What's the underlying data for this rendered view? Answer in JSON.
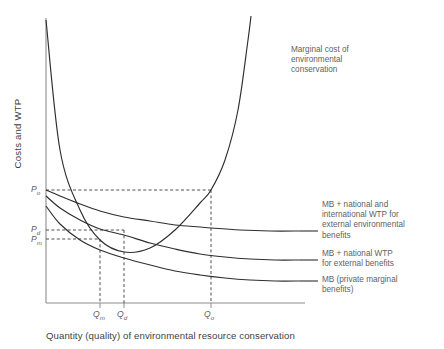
{
  "chart_data": {
    "type": "line",
    "title": "",
    "xlabel": "Quantity (quality) of environmental resource conservation",
    "ylabel": "Costs and WTP",
    "grid": false,
    "legend_position": "right-inline",
    "axis_ranges": {
      "x": [
        0,
        1
      ],
      "y": [
        0,
        1
      ]
    },
    "series": [
      {
        "name": "Marginal cost of environmental conservation",
        "label_lines": [
          "Marginal cost of",
          "environmental",
          "conservation"
        ],
        "shape": "increasing-convex",
        "points_px": [
          [
            46,
            20
          ],
          [
            60,
            150
          ],
          [
            80,
            210
          ],
          [
            100,
            240
          ],
          [
            124,
            252
          ],
          [
            150,
            248
          ],
          [
            175,
            230
          ],
          [
            200,
            203
          ],
          [
            211,
            190
          ],
          [
            225,
            160
          ],
          [
            238,
            110
          ],
          [
            248,
            40
          ],
          [
            251,
            16
          ]
        ]
      },
      {
        "name": "MB + national and international WTP for external environmental benefits",
        "label_lines": [
          "MB + national and",
          "international WTP for",
          "external environmental",
          "benefits"
        ],
        "shape": "decreasing-convex",
        "points_px": [
          [
            46,
            190
          ],
          [
            60,
            196
          ],
          [
            80,
            204
          ],
          [
            100,
            211
          ],
          [
            124,
            217
          ],
          [
            150,
            221
          ],
          [
            175,
            225
          ],
          [
            200,
            227
          ],
          [
            211,
            228
          ],
          [
            240,
            230
          ],
          [
            270,
            231
          ],
          [
            300,
            231
          ]
        ]
      },
      {
        "name": "MB + national WTP for external benefits",
        "label_lines": [
          "MB + national WTP",
          "for external benefits"
        ],
        "shape": "decreasing-convex",
        "points_px": [
          [
            46,
            196
          ],
          [
            60,
            208
          ],
          [
            80,
            220
          ],
          [
            100,
            229
          ],
          [
            124,
            235
          ],
          [
            150,
            243
          ],
          [
            175,
            249
          ],
          [
            200,
            254
          ],
          [
            225,
            257
          ],
          [
            250,
            259
          ],
          [
            275,
            260
          ],
          [
            300,
            260
          ]
        ]
      },
      {
        "name": "MB (private marginal benefits)",
        "label_lines": [
          "MB (private marginal",
          "benefits)"
        ],
        "shape": "decreasing-convex",
        "points_px": [
          [
            46,
            206
          ],
          [
            60,
            224
          ],
          [
            80,
            240
          ],
          [
            100,
            250
          ],
          [
            124,
            258
          ],
          [
            150,
            265
          ],
          [
            175,
            271
          ],
          [
            200,
            275
          ],
          [
            225,
            278
          ],
          [
            250,
            280
          ],
          [
            275,
            281
          ],
          [
            300,
            281
          ]
        ]
      }
    ],
    "equilibria": [
      {
        "name": "market",
        "x_label": "Qm",
        "y_label": "Pm",
        "x_px": 100,
        "y_px": 239
      },
      {
        "name": "domestic",
        "x_label": "Qd",
        "y_label": "Pd",
        "x_px": 124,
        "y_px": 230
      },
      {
        "name": "optimal",
        "x_label": "Qo",
        "y_label": "Po",
        "x_px": 211,
        "y_px": 190
      }
    ],
    "x_ticks": [
      {
        "label": "Q",
        "sub": "m",
        "x_px": 100
      },
      {
        "label": "Q",
        "sub": "d",
        "x_px": 124
      },
      {
        "label": "Q",
        "sub": "o",
        "x_px": 211
      }
    ],
    "y_ticks": [
      {
        "label": "P",
        "sub": "o",
        "y_px": 190
      },
      {
        "label": "P",
        "sub": "d",
        "y_px": 230
      },
      {
        "label": "P",
        "sub": "m",
        "y_px": 239
      }
    ],
    "colors": {
      "curve": "#2e2e2e",
      "axis": "#8c8c8c",
      "dashed": "#3a3a3a",
      "text": "#5a5a5a"
    }
  },
  "axes": {
    "y_title": "Costs and WTP",
    "x_title": "Quantity (quality) of environmental resource conservation"
  },
  "tick_labels": {
    "qm": "Q",
    "qm_sub": "m",
    "qd": "Q",
    "qd_sub": "d",
    "qo": "Q",
    "qo_sub": "o",
    "po": "P",
    "po_sub": "o",
    "pd": "P",
    "pd_sub": "d",
    "pm": "P",
    "pm_sub": "m"
  },
  "annotations": {
    "mc": "Marginal cost of\nenvironmental\nconservation",
    "mb_intl": "MB + national and\ninternational WTP for\nexternal environmental\nbenefits",
    "mb_nat": "MB + national WTP\nfor external benefits",
    "mb_private": "MB (private marginal\nbenefits)"
  }
}
